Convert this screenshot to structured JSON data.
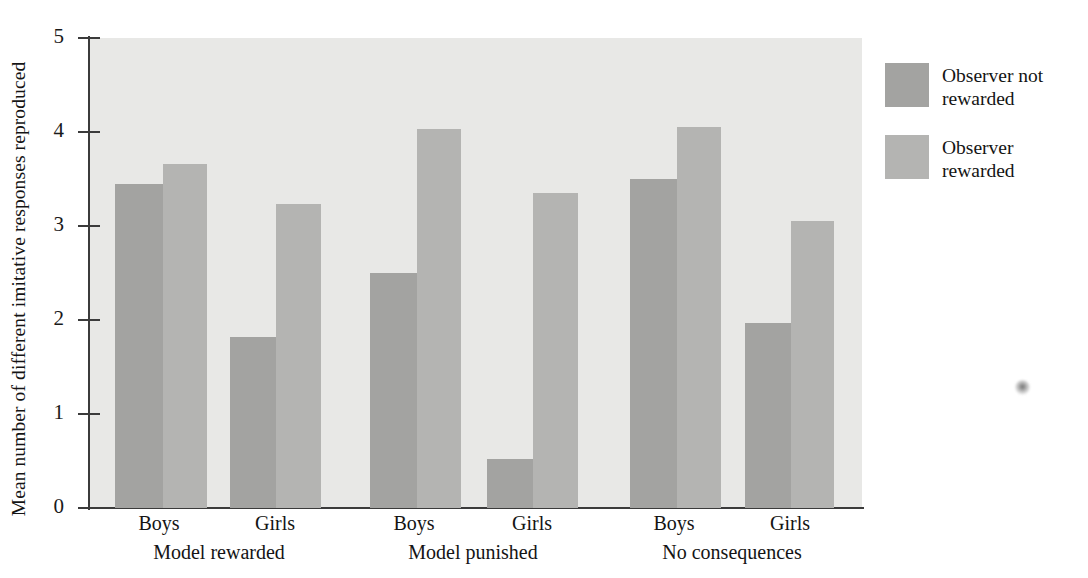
{
  "chart_data": {
    "type": "bar",
    "title": "",
    "xlabel": "",
    "ylabel": "Mean number of different imitative responses reproduced",
    "ylim": [
      0,
      5
    ],
    "y_ticks": [
      "0",
      "1",
      "2",
      "3",
      "4",
      "5"
    ],
    "grid": false,
    "legend_position": "right",
    "categories": [
      "Model rewarded / Boys",
      "Model rewarded / Girls",
      "Model punished / Boys",
      "Model punished / Girls",
      "No consequences / Boys",
      "No consequences / Girls"
    ],
    "groups": [
      {
        "condition": "Model rewarded",
        "subgroups": [
          {
            "sex": "Boys",
            "not_rewarded": 3.45,
            "rewarded": 3.66
          },
          {
            "sex": "Girls",
            "not_rewarded": 1.82,
            "rewarded": 3.23
          }
        ]
      },
      {
        "condition": "Model punished",
        "subgroups": [
          {
            "sex": "Boys",
            "not_rewarded": 2.5,
            "rewarded": 4.03
          },
          {
            "sex": "Girls",
            "not_rewarded": 0.52,
            "rewarded": 3.35
          }
        ]
      },
      {
        "condition": "No consequences",
        "subgroups": [
          {
            "sex": "Boys",
            "not_rewarded": 3.5,
            "rewarded": 4.05
          },
          {
            "sex": "Girls",
            "not_rewarded": 1.97,
            "rewarded": 3.05
          }
        ]
      }
    ],
    "series": [
      {
        "name": "Observer not rewarded",
        "color": "#a3a3a1",
        "values": [
          3.45,
          1.82,
          2.5,
          0.52,
          3.5,
          1.97
        ]
      },
      {
        "name": "Observer rewarded",
        "color": "#b4b4b2",
        "values": [
          3.66,
          3.23,
          4.03,
          3.35,
          4.05,
          3.05
        ]
      }
    ]
  },
  "legend": {
    "items": [
      {
        "label": "Observer not rewarded",
        "color": "#a3a3a1"
      },
      {
        "label": "Observer rewarded",
        "color": "#b4b4b2"
      }
    ]
  },
  "colors": {
    "plot_background": "#e8e8e6",
    "axis": "#3b3b3b",
    "text": "#141414",
    "series_not_rewarded": "#a3a3a1",
    "series_rewarded": "#b4b4b2"
  }
}
